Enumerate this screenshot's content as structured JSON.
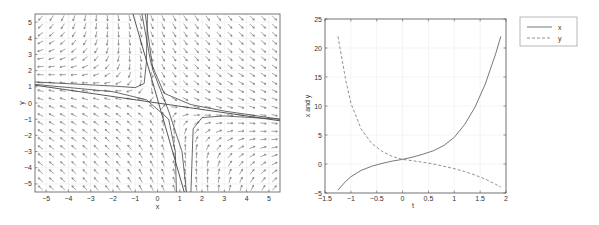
{
  "chart_data": [
    {
      "type": "quiver",
      "title": "",
      "xlabel": "x",
      "ylabel": "y",
      "xlim": [
        -5.5,
        5.5
      ],
      "ylim": [
        -5.5,
        5.5
      ],
      "xticks": [
        "-5",
        "-4",
        "-3",
        "-2",
        "-1",
        "0",
        "1",
        "2",
        "3",
        "4",
        "5"
      ],
      "yticks": [
        "5",
        "4",
        "3",
        "2",
        "1",
        "0",
        "-1",
        "-2",
        "-3",
        "-4",
        "-5"
      ],
      "grid": true,
      "description": "Direction field with saddle point near origin; separatrices along lines y ≈ -0.2x and y ≈ -4x, with hyperbolic trajectories in each quadrant",
      "separatrices": [
        {
          "x": [
            -5.5,
            5.5
          ],
          "y": [
            1.1,
            -1.1
          ]
        },
        {
          "x": [
            -1.1,
            1.2
          ],
          "y": [
            5.5,
            -5.5
          ]
        }
      ],
      "trajectories": [
        {
          "x": [
            -5.5,
            -2,
            -1,
            -0.6,
            -0.5,
            -0.45
          ],
          "y": [
            1.3,
            1.05,
            0.95,
            1.2,
            2.5,
            5.5
          ]
        },
        {
          "x": [
            -0.7,
            -0.3,
            0.3,
            1.5,
            3,
            5.5
          ],
          "y": [
            5.5,
            2.5,
            0.6,
            -0.1,
            -0.5,
            -1.0
          ]
        },
        {
          "x": [
            -5.5,
            -2,
            -0.5,
            0.5,
            0.8,
            0.85
          ],
          "y": [
            1.15,
            0.7,
            0.2,
            -1.0,
            -3,
            -5.5
          ]
        },
        {
          "x": [
            1.5,
            1.6,
            2,
            3,
            5.5
          ],
          "y": [
            -5.5,
            -1.6,
            -0.9,
            -0.8,
            -1.0
          ]
        },
        {
          "x": [
            -0.55,
            -0.2,
            0.5,
            1.1,
            1.3
          ],
          "y": [
            5.5,
            2,
            -0.5,
            -3,
            -5.5
          ]
        }
      ]
    },
    {
      "type": "line",
      "title": "",
      "xlabel": "t",
      "ylabel": "x and y",
      "xlim": [
        -1.5,
        2
      ],
      "ylim": [
        -5,
        25
      ],
      "xticks": [
        "-1.5",
        "-1",
        "-0.5",
        "0",
        "0.5",
        "1",
        "1.5",
        "2"
      ],
      "yticks": [
        "25",
        "20",
        "15",
        "10",
        "5",
        "0",
        "-5"
      ],
      "grid": true,
      "legend": {
        "position": "outside-right-top",
        "entries": [
          "x",
          "y"
        ]
      },
      "series": [
        {
          "name": "x",
          "style": "solid",
          "t": [
            -1.25,
            -1.1,
            -1.0,
            -0.8,
            -0.6,
            -0.4,
            -0.2,
            0,
            0.2,
            0.4,
            0.6,
            0.8,
            1.0,
            1.2,
            1.4,
            1.6,
            1.8,
            1.9
          ],
          "values": [
            -4.5,
            -3.0,
            -2.2,
            -1.1,
            -0.4,
            0.1,
            0.5,
            0.8,
            1.2,
            1.7,
            2.3,
            3.2,
            4.6,
            6.8,
            9.8,
            13.8,
            19.0,
            22.0
          ]
        },
        {
          "name": "y",
          "style": "dashed",
          "t": [
            -1.25,
            -1.1,
            -1.0,
            -0.8,
            -0.6,
            -0.4,
            -0.2,
            0,
            0.2,
            0.4,
            0.6,
            0.8,
            1.0,
            1.2,
            1.4,
            1.6,
            1.8,
            1.9
          ],
          "values": [
            22.0,
            14.5,
            10.5,
            6.0,
            3.6,
            2.2,
            1.3,
            0.8,
            0.55,
            0.3,
            0.0,
            -0.4,
            -0.8,
            -1.3,
            -1.9,
            -2.6,
            -3.5,
            -4.0
          ]
        }
      ]
    }
  ],
  "legend": {
    "x_label": "x",
    "y_label": "y"
  }
}
